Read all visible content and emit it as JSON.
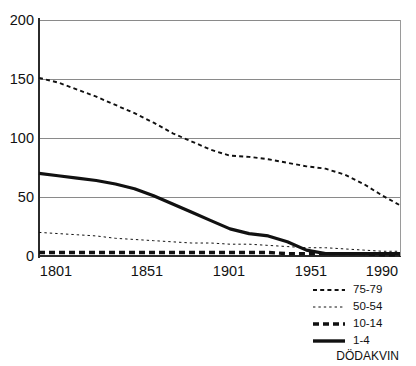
{
  "chart_data": {
    "type": "line",
    "title": "",
    "subtitle": "",
    "xlabel": "",
    "ylabel": "",
    "caption": "DÖDAKVIN",
    "xlim": [
      1801,
      1990
    ],
    "ylim": [
      0,
      200
    ],
    "grid": true,
    "grid_axis": "y",
    "legend_position": "bottom-right",
    "yticks": [
      0,
      50,
      100,
      150,
      200
    ],
    "ytick_labels": [
      "0",
      "50",
      "100",
      "150",
      "200"
    ],
    "xticks": [
      1801,
      1851,
      1901,
      1951,
      1990
    ],
    "xtick_labels": [
      "1801",
      "1851",
      "1901",
      "1951",
      "1990"
    ],
    "series": [
      {
        "name": "75-79",
        "style": "dashed",
        "color": "#111111",
        "x": [
          1801,
          1811,
          1821,
          1831,
          1841,
          1851,
          1861,
          1871,
          1881,
          1891,
          1901,
          1911,
          1921,
          1931,
          1941,
          1951,
          1961,
          1971,
          1981,
          1990
        ],
        "values": [
          151,
          147,
          141,
          135,
          128,
          121,
          113,
          104,
          97,
          90,
          85,
          84,
          82,
          79,
          76,
          74,
          69,
          61,
          51,
          43
        ]
      },
      {
        "name": "50-54",
        "style": "dotted",
        "color": "#111111",
        "x": [
          1801,
          1811,
          1821,
          1831,
          1841,
          1851,
          1861,
          1871,
          1881,
          1891,
          1901,
          1911,
          1921,
          1931,
          1941,
          1951,
          1961,
          1971,
          1981,
          1990
        ],
        "values": [
          20,
          19,
          18,
          17,
          15,
          14,
          13,
          12,
          11,
          11,
          10,
          10,
          9,
          8,
          7,
          7,
          6,
          5,
          4,
          4
        ]
      },
      {
        "name": "10-14",
        "style": "thick-dashed",
        "color": "#111111",
        "x": [
          1801,
          1811,
          1821,
          1831,
          1841,
          1851,
          1861,
          1871,
          1881,
          1891,
          1901,
          1911,
          1921,
          1931,
          1941,
          1951,
          1961,
          1971,
          1981,
          1990
        ],
        "values": [
          3,
          3,
          3,
          3,
          3,
          3,
          3,
          3,
          3,
          3,
          3,
          3,
          3,
          2,
          2,
          2,
          2,
          2,
          1,
          1
        ]
      },
      {
        "name": "1-4",
        "style": "solid",
        "color": "#111111",
        "x": [
          1801,
          1811,
          1821,
          1831,
          1841,
          1851,
          1861,
          1871,
          1881,
          1891,
          1901,
          1911,
          1921,
          1931,
          1941,
          1951,
          1961,
          1971,
          1981,
          1990
        ],
        "values": [
          70,
          68,
          66,
          64,
          61,
          57,
          51,
          44,
          37,
          30,
          23,
          19,
          17,
          12,
          5,
          2,
          2,
          2,
          2,
          2
        ]
      }
    ]
  },
  "legend": {
    "items": [
      {
        "label": "75-79",
        "style": "dashed"
      },
      {
        "label": "50-54",
        "style": "dotted"
      },
      {
        "label": "10-14",
        "style": "thick-dashed"
      },
      {
        "label": "1-4",
        "style": "solid"
      }
    ],
    "caption": "DÖDAKVIN"
  }
}
